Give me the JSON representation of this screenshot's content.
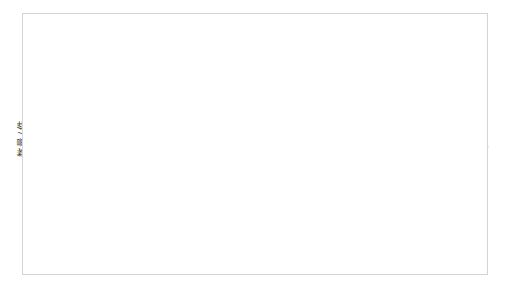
{
  "chart_data": {
    "type": "line",
    "title": "",
    "xlabel": "年份",
    "ylabel": "数量 / 件",
    "categories": [
      "2003",
      "2004",
      "2005",
      "2006",
      "2007",
      "2008",
      "2009",
      "2010",
      "2011",
      "2012",
      "2013",
      "2014",
      "2015",
      "2016",
      "2017",
      "2018",
      "2019"
    ],
    "values": [
      4,
      2,
      6,
      1,
      7,
      5,
      4,
      3,
      9,
      3,
      8,
      20,
      20,
      28,
      64,
      68,
      38
    ],
    "series": [
      {
        "name": "数量",
        "values": [
          4,
          2,
          6,
          1,
          7,
          5,
          4,
          3,
          9,
          3,
          8,
          20,
          20,
          28,
          64,
          68,
          38
        ]
      }
    ],
    "data_labels": [
      "4",
      "2",
      "6",
      "1",
      "7",
      "5",
      "4",
      "3",
      "9",
      "3",
      "8",
      "20",
      "20",
      "28",
      "64",
      "68",
      "38"
    ],
    "ylim": [
      0,
      80
    ],
    "yticks": [
      0,
      10,
      20,
      30,
      40,
      50,
      60,
      70,
      80
    ],
    "ytick_labels": [
      "0",
      "10",
      "20",
      "30",
      "40",
      "50",
      "60",
      "70",
      "80"
    ],
    "grid": true,
    "grid_axis": "y",
    "legend": false,
    "legend_position": "none",
    "line_color": "#3b3b3b",
    "grid_color": "#e2e2e2",
    "axis_color": "#b9b9b9",
    "background": "#ffffff",
    "border_color": "#d4d4d4"
  }
}
